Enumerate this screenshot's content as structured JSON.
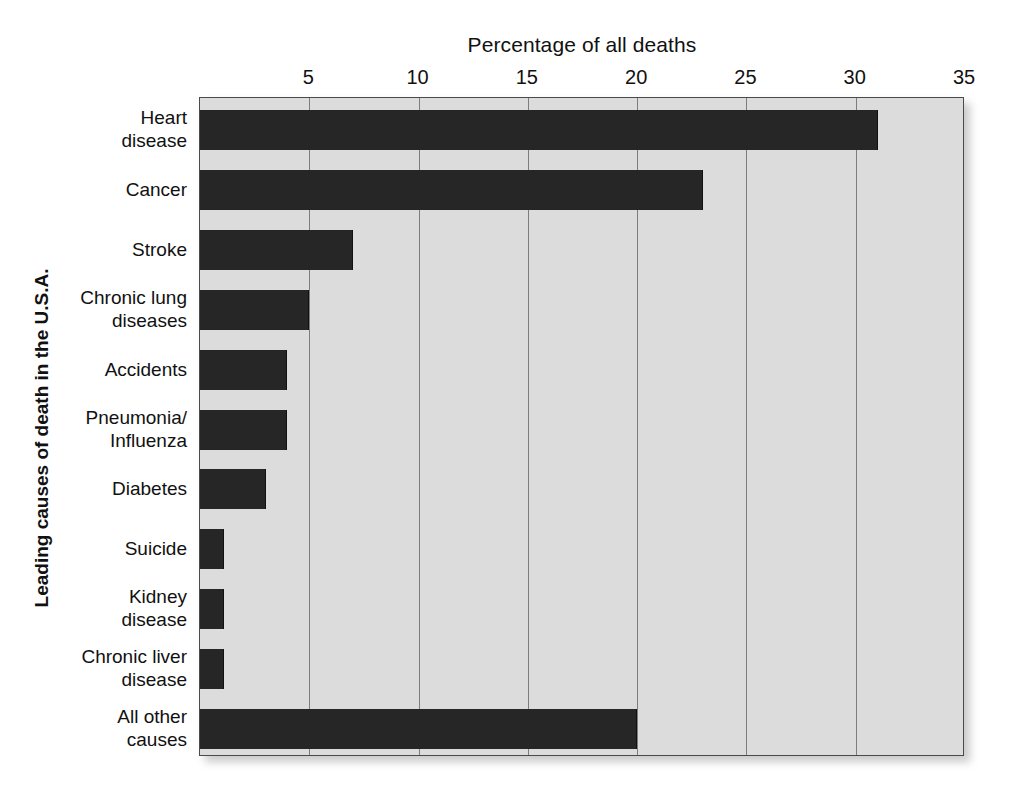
{
  "chart_data": {
    "type": "bar",
    "orientation": "horizontal",
    "title": "",
    "xlabel": "Percentage of all deaths",
    "ylabel": "Leading causes of death in the U.S.A.",
    "xlim": [
      0,
      35
    ],
    "xticks": [
      5,
      10,
      15,
      20,
      25,
      30,
      35
    ],
    "xtick_labels": [
      "5",
      "10",
      "15",
      "20",
      "25",
      "30",
      "35"
    ],
    "grid": true,
    "grid_axis": "x",
    "legend": false,
    "bar_color": "#262626",
    "plot_background": "#dcdcdc",
    "categories": [
      "Heart\ndisease",
      "Cancer",
      "Stroke",
      "Chronic lung\ndiseases",
      "Accidents",
      "Pneumonia/\nInfluenza",
      "Diabetes",
      "Suicide",
      "Kidney\ndisease",
      "Chronic liver\ndisease",
      "All other\ncauses"
    ],
    "values": [
      31,
      23,
      7,
      5,
      4,
      4,
      3,
      1.1,
      1.1,
      1.1,
      20
    ]
  }
}
